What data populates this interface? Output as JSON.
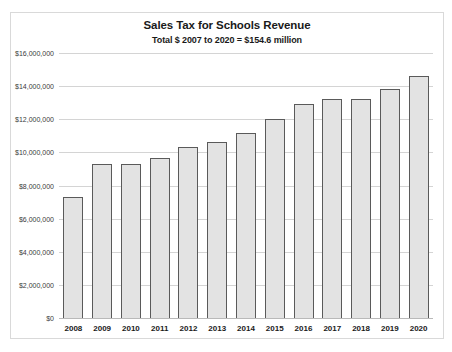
{
  "chart_data": {
    "type": "bar",
    "title": "Sales Tax for Schools Revenue",
    "subtitle": "Total $ 2007 to 2020 = $154.6 million",
    "xlabel": "",
    "ylabel": "",
    "categories": [
      "2008",
      "2009",
      "2010",
      "2011",
      "2012",
      "2013",
      "2014",
      "2015",
      "2016",
      "2017",
      "2018",
      "2019",
      "2020"
    ],
    "values": [
      7300000,
      9300000,
      9300000,
      9650000,
      10300000,
      10650000,
      11200000,
      12000000,
      12900000,
      13200000,
      13200000,
      13850000,
      14600000
    ],
    "ylim": [
      0,
      16000000
    ],
    "y_ticks": [
      0,
      2000000,
      4000000,
      6000000,
      8000000,
      10000000,
      12000000,
      14000000,
      16000000
    ],
    "y_tick_labels": [
      "$0",
      "$2,000,000",
      "$4,000,000",
      "$6,000,000",
      "$8,000,000",
      "$10,000,000",
      "$12,000,000",
      "$14,000,000",
      "$16,000,000"
    ],
    "grid": true,
    "legend": null,
    "colors": {
      "bar_fill": "#e3e3e3",
      "bar_border": "#5a5a5a",
      "gridline": "#d4d4d4",
      "frame": "#d9d9d9",
      "text": "#1a1a1a"
    }
  }
}
